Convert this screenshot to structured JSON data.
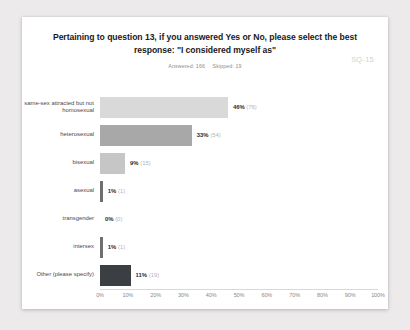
{
  "card": {
    "title": "Pertaining to question 13, if you answered Yes or No, please select the best response: \"I considered myself as\"",
    "answered_label": "Answered: 166",
    "skipped_label": "Skipped: 19",
    "question_code": "SQ-15"
  },
  "chart_data": {
    "type": "bar",
    "orientation": "horizontal",
    "title": "Pertaining to question 13, if you answered Yes or No, please select the best response: \"I considered myself as\"",
    "xlabel": "",
    "ylabel": "",
    "xlim": [
      0,
      100
    ],
    "grid": false,
    "legend": "none",
    "categories": [
      "same-sex attracted but not homosexual",
      "heterosexual",
      "bisexual",
      "asexual",
      "transgender",
      "intersex",
      "Other (please specify)"
    ],
    "values": [
      46,
      33,
      9,
      1,
      0,
      1,
      11
    ],
    "counts": [
      76,
      54,
      15,
      1,
      0,
      1,
      19
    ],
    "percent_labels": [
      "46%",
      "33%",
      "9%",
      "1%",
      "0%",
      "1%",
      "11%"
    ],
    "count_labels": [
      "(76)",
      "(54)",
      "(15)",
      "(1)",
      "(0)",
      "(1)",
      "(19)"
    ],
    "bar_colors": [
      "#d9d9d9",
      "#a8a8a8",
      "#c6c6c6",
      "#6f6f6f",
      "#bdbdbd",
      "#6f6f6f",
      "#3b3f44"
    ],
    "xticks": [
      0,
      10,
      20,
      30,
      40,
      50,
      60,
      70,
      80,
      90,
      100
    ],
    "xtick_labels": [
      "0%",
      "10%",
      "20%",
      "30%",
      "40%",
      "50%",
      "60%",
      "70%",
      "80%",
      "90%",
      "100%"
    ]
  }
}
